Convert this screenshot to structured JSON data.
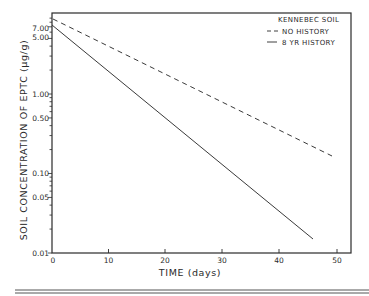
{
  "chart_data": {
    "type": "line",
    "title": "",
    "xlabel": "TIME (days)",
    "ylabel": "SOIL CONCENTRATION OF EPTC (μg/g)",
    "xlim": [
      0,
      52
    ],
    "ylim": [
      0.01,
      10
    ],
    "yscale": "log",
    "x_ticks": [
      0,
      10,
      20,
      30,
      40,
      50
    ],
    "x_tick_labels": [
      "0",
      "10",
      "20",
      "30",
      "40",
      "50"
    ],
    "y_tick_labels": [
      {
        "value": 7.0,
        "label": "7.00"
      },
      {
        "value": 5.0,
        "label": "5.00"
      },
      {
        "value": 1.0,
        "label": "1.00"
      },
      {
        "value": 0.5,
        "label": "0.50"
      },
      {
        "value": 0.1,
        "label": "0.10"
      },
      {
        "value": 0.05,
        "label": "0.05"
      },
      {
        "value": 0.01,
        "label": "0.01"
      }
    ],
    "grid": false,
    "legend_position": "upper right",
    "legend_title": "KENNEBEC SOIL",
    "series": [
      {
        "name": "NO HISTORY",
        "style": "dashed",
        "x": [
          0,
          49
        ],
        "values": [
          8.7,
          0.17
        ]
      },
      {
        "name": "8 YR HISTORY",
        "style": "solid",
        "x": [
          0,
          45.8
        ],
        "values": [
          7.4,
          0.015
        ]
      }
    ]
  },
  "legend": {
    "title": "KENNEBEC SOIL",
    "items": [
      {
        "marker": "- -",
        "label": "NO HISTORY"
      },
      {
        "marker": "—",
        "label": "8 YR HISTORY"
      }
    ]
  },
  "axes": {
    "xlabel": "TIME (days)",
    "ylabel": "SOIL CONCENTRATION OF EPTC (μg/g)",
    "x_ticks": [
      "0",
      "10",
      "20",
      "30",
      "40",
      "50"
    ],
    "y_ticks": [
      "7.00",
      "5.00",
      "1.00",
      "0.50",
      "0.10",
      "0.05",
      "0.01"
    ]
  }
}
